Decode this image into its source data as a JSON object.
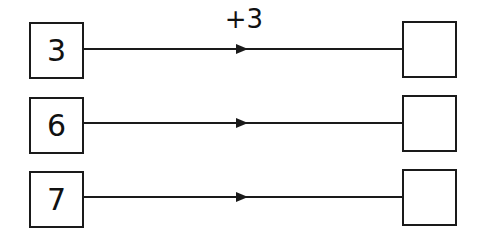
{
  "diagram": {
    "type": "function-machine",
    "operation_label": "+3",
    "rows": [
      {
        "input": "3",
        "output": ""
      },
      {
        "input": "6",
        "output": ""
      },
      {
        "input": "7",
        "output": ""
      }
    ],
    "colors": {
      "stroke": "#1a1a1a",
      "text": "#111111",
      "background": "#ffffff"
    }
  }
}
